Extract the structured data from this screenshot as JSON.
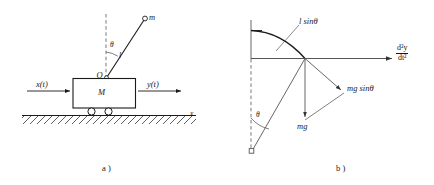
{
  "figure": {
    "panel_a": {
      "caption": "a )",
      "labels": {
        "bob_mass": "m",
        "pivot": "O",
        "rod_length": "l",
        "angle": "θ",
        "cart_mass": "M",
        "input": "x(t)",
        "output": "y(t)",
        "ground_axis": "x"
      }
    },
    "panel_b": {
      "caption": "b )",
      "labels": {
        "arc_length": "l sinθ",
        "angle": "θ",
        "weight": "mg",
        "tangential_force": "mg sinθ",
        "acceleration_numerator": "d²y",
        "acceleration_denominator": "dt²"
      }
    }
  },
  "style": {
    "stroke": "#1a1a1a",
    "light_stroke": "#555555",
    "background": "#ffffff"
  }
}
